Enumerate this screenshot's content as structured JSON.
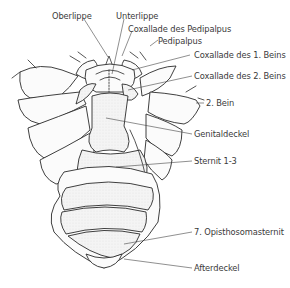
{
  "diagram": {
    "labels": [
      {
        "id": "oberlippe",
        "text": "Oberlippe"
      },
      {
        "id": "unterlippe",
        "text": "Unterlippe"
      },
      {
        "id": "coxallade-pedipalpus",
        "text": "Coxallade des Pedipalpus"
      },
      {
        "id": "pedipalpus",
        "text": "Pedipalpus"
      },
      {
        "id": "coxallade-1-beins",
        "text": "Coxallade des 1. Beins"
      },
      {
        "id": "coxallade-2-beins",
        "text": "Coxallade des 2. Beins"
      },
      {
        "id": "bein-2",
        "text": "2. Bein"
      },
      {
        "id": "genitaldeckel",
        "text": "Genitaldeckel"
      },
      {
        "id": "sternit",
        "text": "Sternit 1-3"
      },
      {
        "id": "opisthosomasternit-7",
        "text": "7. Opisthosomasternit"
      },
      {
        "id": "afterdeckel",
        "text": "Afterdeckel"
      }
    ]
  }
}
